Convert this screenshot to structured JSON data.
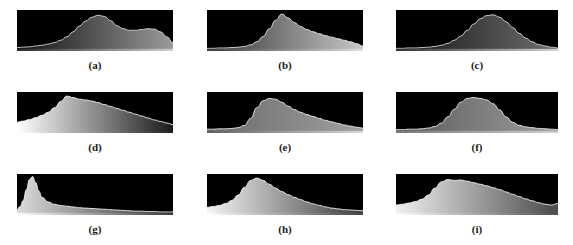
{
  "figure": {
    "title": "",
    "caption": "",
    "background_color": "#ffffff",
    "panel_background_color": "#000000",
    "label_color": "#1a1a1a",
    "rows": 3,
    "columns": 3
  },
  "chart_data": {
    "type": "line",
    "xlabel": "",
    "ylabel": "",
    "xlim": [
      0,
      255
    ],
    "ylim": [
      0,
      1
    ],
    "grid": false,
    "legend": "none",
    "panels": [
      {
        "id": "a",
        "label": "(a)",
        "fill_start": "#111111",
        "fill_end": "#9a9a9a",
        "curve_color": "#d8d8d8",
        "base_start": "#2a2a2a",
        "base_end": "#cfcfcf",
        "x": [
          0,
          4,
          8,
          12,
          16,
          20,
          24,
          28,
          32,
          36,
          40,
          44,
          48,
          52,
          56,
          60,
          64,
          68,
          72,
          76,
          80,
          84,
          88,
          92,
          96,
          100
        ],
        "y": [
          0.05,
          0.06,
          0.07,
          0.09,
          0.11,
          0.14,
          0.18,
          0.24,
          0.33,
          0.46,
          0.61,
          0.74,
          0.84,
          0.89,
          0.86,
          0.75,
          0.62,
          0.54,
          0.5,
          0.5,
          0.52,
          0.54,
          0.53,
          0.46,
          0.33,
          0.18
        ]
      },
      {
        "id": "b",
        "label": "(b)",
        "fill_start": "#353535",
        "fill_end": "#c8c8c8",
        "curve_color": "#e8e8e8",
        "base_start": "#3c3c3c",
        "base_end": "#dedede",
        "x": [
          0,
          4,
          8,
          12,
          16,
          20,
          24,
          28,
          32,
          36,
          40,
          44,
          48,
          52,
          56,
          60,
          64,
          68,
          72,
          76,
          80,
          84,
          88,
          92,
          96,
          100
        ],
        "y": [
          0.03,
          0.03,
          0.04,
          0.04,
          0.05,
          0.06,
          0.08,
          0.12,
          0.2,
          0.34,
          0.54,
          0.76,
          0.92,
          0.82,
          0.7,
          0.6,
          0.52,
          0.46,
          0.41,
          0.36,
          0.32,
          0.28,
          0.24,
          0.2,
          0.15,
          0.09
        ]
      },
      {
        "id": "c",
        "label": "(c)",
        "fill_start": "#141414",
        "fill_end": "#6e6e6e",
        "curve_color": "#dcdcdc",
        "base_start": "#323232",
        "base_end": "#d2d2d2",
        "x": [
          0,
          4,
          8,
          12,
          16,
          20,
          24,
          28,
          32,
          36,
          40,
          44,
          48,
          52,
          56,
          60,
          64,
          68,
          72,
          76,
          80,
          84,
          88,
          92,
          96,
          100
        ],
        "y": [
          0.03,
          0.03,
          0.04,
          0.04,
          0.05,
          0.06,
          0.08,
          0.11,
          0.16,
          0.24,
          0.35,
          0.5,
          0.66,
          0.8,
          0.88,
          0.9,
          0.84,
          0.72,
          0.57,
          0.42,
          0.3,
          0.2,
          0.13,
          0.09,
          0.06,
          0.04
        ]
      },
      {
        "id": "d",
        "label": "(d)",
        "fill_start": "#ffffff",
        "fill_end": "#1a1a1a",
        "curve_color": "#f2f2f2",
        "base_start": "#ffffff",
        "base_end": "#202020",
        "x": [
          0,
          4,
          8,
          12,
          16,
          20,
          24,
          28,
          32,
          36,
          40,
          44,
          48,
          52,
          56,
          60,
          64,
          68,
          72,
          76,
          80,
          84,
          88,
          92,
          96,
          100
        ],
        "y": [
          0.24,
          0.27,
          0.31,
          0.36,
          0.42,
          0.5,
          0.62,
          0.78,
          0.92,
          0.88,
          0.84,
          0.82,
          0.79,
          0.75,
          0.7,
          0.65,
          0.6,
          0.55,
          0.5,
          0.45,
          0.4,
          0.35,
          0.3,
          0.26,
          0.22,
          0.18
        ]
      },
      {
        "id": "e",
        "label": "(e)",
        "fill_start": "#6a6a6a",
        "fill_end": "#a0a0a0",
        "curve_color": "#ededed",
        "base_start": "#606060",
        "base_end": "#d6d6d6",
        "x": [
          0,
          4,
          8,
          12,
          16,
          20,
          24,
          28,
          32,
          36,
          40,
          44,
          48,
          52,
          56,
          60,
          64,
          68,
          72,
          76,
          80,
          84,
          88,
          92,
          96,
          100
        ],
        "y": [
          0.06,
          0.06,
          0.07,
          0.07,
          0.08,
          0.1,
          0.16,
          0.34,
          0.62,
          0.8,
          0.86,
          0.84,
          0.76,
          0.66,
          0.57,
          0.5,
          0.44,
          0.39,
          0.34,
          0.29,
          0.25,
          0.21,
          0.17,
          0.14,
          0.11,
          0.09
        ]
      },
      {
        "id": "f",
        "label": "(f)",
        "fill_start": "#5c5c5c",
        "fill_end": "#9c9c9c",
        "curve_color": "#ececec",
        "base_start": "#787878",
        "base_end": "#d0d0d0",
        "x": [
          0,
          4,
          8,
          12,
          16,
          20,
          24,
          28,
          32,
          36,
          40,
          44,
          48,
          52,
          56,
          60,
          64,
          68,
          72,
          76,
          80,
          84,
          88,
          92,
          96,
          100
        ],
        "y": [
          0.05,
          0.05,
          0.06,
          0.06,
          0.07,
          0.09,
          0.13,
          0.22,
          0.38,
          0.58,
          0.76,
          0.86,
          0.88,
          0.86,
          0.82,
          0.72,
          0.56,
          0.38,
          0.24,
          0.16,
          0.12,
          0.1,
          0.08,
          0.07,
          0.06,
          0.05
        ]
      },
      {
        "id": "g",
        "label": "(g)",
        "fill_start": "#dcdcdc",
        "fill_end": "#2c2c2c",
        "curve_color": "#f0f0f0",
        "base_start": "#ffffff",
        "base_end": "#3a3a3a",
        "x": [
          0,
          2,
          4,
          6,
          8,
          10,
          12,
          14,
          16,
          20,
          24,
          28,
          32,
          36,
          40,
          44,
          48,
          52,
          56,
          60,
          64,
          68,
          72,
          76,
          80,
          84,
          88,
          92,
          96,
          100
        ],
        "y": [
          0.1,
          0.18,
          0.34,
          0.62,
          0.88,
          0.96,
          0.8,
          0.58,
          0.42,
          0.3,
          0.24,
          0.21,
          0.19,
          0.17,
          0.15,
          0.14,
          0.13,
          0.12,
          0.11,
          0.1,
          0.09,
          0.08,
          0.07,
          0.06,
          0.06,
          0.05,
          0.05,
          0.04,
          0.04,
          0.04
        ]
      },
      {
        "id": "h",
        "label": "(h)",
        "fill_start": "#f4f4f4",
        "fill_end": "#3a3a3a",
        "curve_color": "#f4f4f4",
        "base_start": "#ffffff",
        "base_end": "#444444",
        "x": [
          0,
          4,
          8,
          12,
          16,
          20,
          24,
          28,
          32,
          36,
          40,
          44,
          48,
          52,
          56,
          60,
          64,
          68,
          72,
          76,
          80,
          84,
          88,
          92,
          96,
          100
        ],
        "y": [
          0.16,
          0.18,
          0.21,
          0.26,
          0.34,
          0.48,
          0.68,
          0.86,
          0.92,
          0.86,
          0.76,
          0.66,
          0.57,
          0.49,
          0.42,
          0.36,
          0.3,
          0.25,
          0.21,
          0.17,
          0.14,
          0.12,
          0.1,
          0.09,
          0.08,
          0.07
        ]
      },
      {
        "id": "i",
        "label": "(i)",
        "fill_start": "#f0f0f0",
        "fill_end": "#4a4a4a",
        "curve_color": "#f0f0f0",
        "base_start": "#ffffff",
        "base_end": "#4e4e4e",
        "x": [
          0,
          4,
          8,
          12,
          16,
          20,
          24,
          28,
          32,
          36,
          40,
          44,
          48,
          52,
          56,
          60,
          64,
          68,
          72,
          76,
          80,
          84,
          88,
          92,
          96,
          100
        ],
        "y": [
          0.22,
          0.24,
          0.27,
          0.31,
          0.37,
          0.48,
          0.66,
          0.82,
          0.88,
          0.86,
          0.87,
          0.84,
          0.8,
          0.76,
          0.72,
          0.67,
          0.62,
          0.56,
          0.5,
          0.44,
          0.38,
          0.33,
          0.28,
          0.24,
          0.22,
          0.26
        ]
      }
    ]
  }
}
